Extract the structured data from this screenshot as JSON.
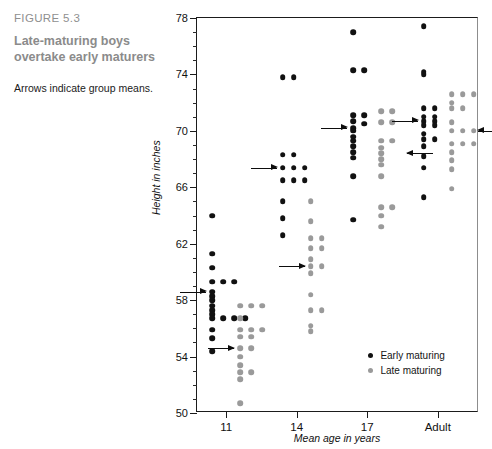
{
  "caption": {
    "figure_number": "FIGURE 5.3",
    "title": "Late-maturing boys overtake early maturers",
    "note": "Arrows indicate group means."
  },
  "legend": {
    "items": [
      {
        "label": "Early maturing",
        "series": "early",
        "color": "#111111"
      },
      {
        "label": "Late maturing",
        "series": "late",
        "color": "#9a9a9a"
      }
    ]
  },
  "chart_data": {
    "type": "scatter",
    "title": "Late-maturing boys overtake early maturers",
    "subtitle": "Arrows indicate group means.",
    "annotation": "Arrows indicate group means.",
    "xlabel": "Mean age in years",
    "ylabel": "Height in inches",
    "categories": [
      "11",
      "14",
      "17",
      "Adult"
    ],
    "ylim": [
      50,
      78
    ],
    "ytick_major": [
      50,
      54,
      58,
      62,
      66,
      70,
      74,
      78
    ],
    "ytick_minor_step": 1,
    "grid": false,
    "legend_position": "inside-bottom-right",
    "series": [
      {
        "name": "Early maturing",
        "color": "#111111",
        "groups": [
          {
            "category": "11",
            "mean": 58.6,
            "values": [
              64.0,
              61.3,
              60.3,
              59.3,
              59.3,
              59.3,
              58.6,
              58.3,
              58.0,
              57.6,
              57.3,
              57.0,
              56.7,
              56.7,
              56.7,
              56.7,
              55.9,
              55.3,
              54.4
            ]
          },
          {
            "category": "14",
            "mean": 67.4,
            "values": [
              73.8,
              73.8,
              68.3,
              68.3,
              67.4,
              67.4,
              67.4,
              66.5,
              66.5,
              66.5,
              65.0,
              63.8,
              62.6
            ]
          },
          {
            "category": "17",
            "mean": 70.2,
            "values": [
              77.0,
              74.3,
              74.3,
              71.1,
              71.1,
              70.7,
              70.5,
              70.2,
              70.0,
              69.6,
              69.3,
              68.9,
              68.5,
              68.1,
              66.8,
              63.7
            ]
          },
          {
            "category": "Adult",
            "mean": 70.7,
            "values": [
              77.4,
              74.2,
              74.0,
              71.6,
              71.6,
              71.0,
              71.0,
              70.7,
              70.7,
              70.4,
              70.4,
              69.8,
              69.4,
              69.4,
              68.9,
              68.2,
              67.4,
              65.3
            ]
          }
        ]
      },
      {
        "name": "Late maturing",
        "color": "#9a9a9a",
        "groups": [
          {
            "category": "11",
            "mean": 54.6,
            "values": [
              57.6,
              57.6,
              57.6,
              56.7,
              55.9,
              55.9,
              55.9,
              55.4,
              55.4,
              54.6,
              54.6,
              54.0,
              53.4,
              52.9,
              52.4,
              52.9,
              50.7
            ]
          },
          {
            "category": "14",
            "mean": 60.4,
            "values": [
              65.0,
              63.6,
              62.4,
              62.4,
              61.7,
              61.7,
              60.9,
              60.4,
              60.4,
              59.9,
              58.4,
              57.3,
              57.3,
              56.2,
              55.8
            ]
          },
          {
            "category": "17",
            "mean": 68.4,
            "values": [
              71.4,
              71.4,
              70.6,
              70.6,
              69.3,
              69.3,
              68.8,
              68.4,
              68.0,
              67.6,
              66.8,
              64.6,
              64.6,
              64.0,
              63.2
            ]
          },
          {
            "category": "Adult",
            "mean": 70.0,
            "values": [
              72.6,
              72.6,
              72.6,
              71.6,
              71.6,
              70.6,
              70.0,
              70.0,
              70.0,
              69.1,
              69.1,
              69.1,
              68.5,
              67.9,
              67.3,
              65.9,
              72.0
            ]
          }
        ]
      }
    ],
    "means": [
      {
        "category": "11",
        "series": "early",
        "value": 58.6,
        "direction": "right"
      },
      {
        "category": "11",
        "series": "late",
        "value": 54.6,
        "direction": "right"
      },
      {
        "category": "14",
        "series": "early",
        "value": 67.4,
        "direction": "right"
      },
      {
        "category": "14",
        "series": "late",
        "value": 60.4,
        "direction": "right"
      },
      {
        "category": "17",
        "series": "early",
        "value": 70.2,
        "direction": "right"
      },
      {
        "category": "17",
        "series": "late",
        "value": 68.4,
        "direction": "left"
      },
      {
        "category": "Adult",
        "series": "early",
        "value": 70.7,
        "direction": "right"
      },
      {
        "category": "Adult",
        "series": "late",
        "value": 70.0,
        "direction": "left"
      }
    ]
  }
}
